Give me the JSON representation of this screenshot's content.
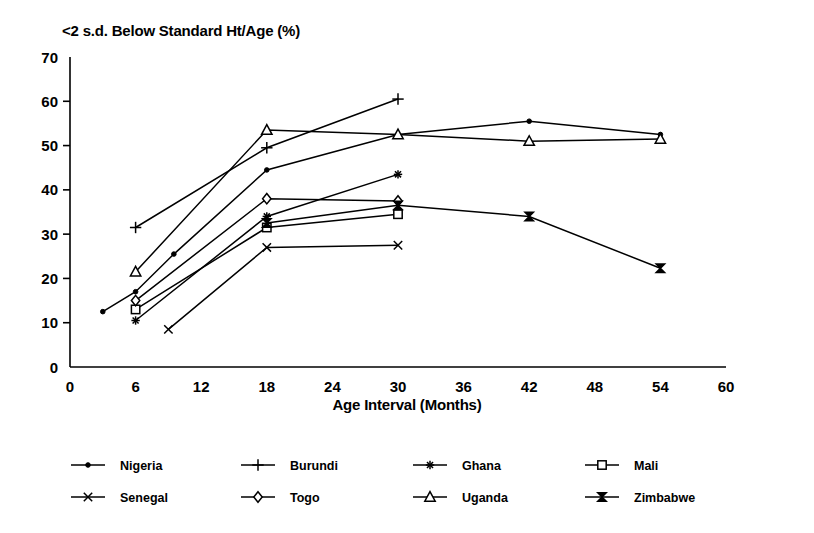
{
  "chart_data": {
    "type": "line",
    "title": "<2 s.d. Below Standard Ht/Age (%)",
    "xlabel": "Age Interval (Months)",
    "ylabel": "",
    "xlim": [
      0,
      60
    ],
    "ylim": [
      0,
      70
    ],
    "xticks": [
      0,
      6,
      12,
      18,
      24,
      30,
      36,
      42,
      48,
      54,
      60
    ],
    "yticks": [
      0,
      10,
      20,
      30,
      40,
      50,
      60,
      70
    ],
    "xtick_labels": [
      "0",
      "6",
      "12",
      "18",
      "24",
      "30",
      "36",
      "42",
      "48",
      "54",
      "60"
    ],
    "ytick_labels": [
      "0",
      "10",
      "20",
      "30",
      "40",
      "50",
      "60",
      "70"
    ],
    "grid": false,
    "legend_position": "below",
    "series": [
      {
        "name": "Nigeria",
        "marker": "dot",
        "points": [
          [
            3,
            12.5
          ],
          [
            6,
            17.0
          ],
          [
            9.5,
            25.5
          ],
          [
            18,
            44.5
          ],
          [
            30,
            52.5
          ],
          [
            42,
            55.5
          ],
          [
            54,
            52.5
          ]
        ]
      },
      {
        "name": "Burundi",
        "marker": "plus",
        "points": [
          [
            6,
            31.5
          ],
          [
            18,
            49.5
          ],
          [
            30,
            60.5
          ]
        ]
      },
      {
        "name": "Ghana",
        "marker": "asterisk",
        "points": [
          [
            6,
            10.5
          ],
          [
            18,
            34.0
          ],
          [
            30,
            43.5
          ]
        ]
      },
      {
        "name": "Mali",
        "marker": "square",
        "points": [
          [
            6,
            13.0
          ],
          [
            18,
            31.5
          ],
          [
            30,
            34.5
          ]
        ]
      },
      {
        "name": "Senegal",
        "marker": "cross",
        "points": [
          [
            9,
            8.5
          ],
          [
            18,
            27.0
          ],
          [
            30,
            27.5
          ]
        ]
      },
      {
        "name": "Togo",
        "marker": "diamond",
        "points": [
          [
            6,
            15.0
          ],
          [
            18,
            38.0
          ],
          [
            30,
            37.5
          ]
        ]
      },
      {
        "name": "Uganda",
        "marker": "triangle",
        "points": [
          [
            6,
            21.5
          ],
          [
            18,
            53.5
          ],
          [
            30,
            52.5
          ],
          [
            42,
            51.0
          ],
          [
            54,
            51.5
          ]
        ]
      },
      {
        "name": "Zimbabwe",
        "marker": "bowtie",
        "points": [
          [
            18,
            32.5
          ],
          [
            30,
            36.5
          ],
          [
            42,
            34.0
          ],
          [
            54,
            22.3
          ]
        ]
      }
    ]
  },
  "legend": {
    "entries": [
      {
        "label": "Nigeria",
        "marker": "dot"
      },
      {
        "label": "Burundi",
        "marker": "plus"
      },
      {
        "label": "Ghana",
        "marker": "asterisk"
      },
      {
        "label": "Mali",
        "marker": "square"
      },
      {
        "label": "Senegal",
        "marker": "cross"
      },
      {
        "label": "Togo",
        "marker": "diamond"
      },
      {
        "label": "Uganda",
        "marker": "triangle"
      },
      {
        "label": "Zimbabwe",
        "marker": "bowtie"
      }
    ]
  },
  "colors": {
    "line": "#000000",
    "axis": "#000000",
    "background": "#ffffff"
  }
}
